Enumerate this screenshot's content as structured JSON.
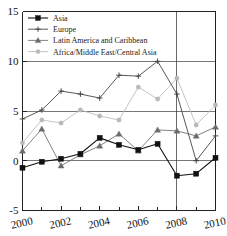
{
  "chart_data": {
    "type": "line",
    "title": "",
    "subtitle": "",
    "xlabel": "",
    "ylabel": "",
    "x": [
      2000,
      2001,
      2002,
      2003,
      2004,
      2005,
      2006,
      2007,
      2008,
      2009,
      2010
    ],
    "xlim": [
      2000,
      2010
    ],
    "ylim": [
      -5,
      15
    ],
    "grid": true,
    "legend_position": "top-left",
    "y_ticks": [
      -5,
      0,
      5,
      10,
      15
    ],
    "y_tick_labels": [
      "-5",
      "0",
      "5",
      "10",
      "15"
    ],
    "x_ticks": [
      2000,
      2001,
      2002,
      2003,
      2004,
      2005,
      2006,
      2007,
      2008,
      2009,
      2010
    ],
    "x_tick_labels_major": [
      "2000",
      "2002",
      "2004",
      "2006",
      "2008",
      "2010"
    ],
    "x_major_ticks": [
      2000,
      2002,
      2004,
      2006,
      2008,
      2010
    ],
    "annotations": [
      {
        "type": "vline",
        "x": 2008,
        "label": ""
      }
    ],
    "series": [
      {
        "name": "Asia",
        "marker": "filled-square",
        "color": "#111111",
        "values": [
          -0.7,
          -0.1,
          0.2,
          0.7,
          2.3,
          1.6,
          1.1,
          1.7,
          -1.5,
          -1.3,
          0.3
        ]
      },
      {
        "name": "Europe",
        "marker": "plus",
        "color": "#3a3a3a",
        "values": [
          4.2,
          5.1,
          7.0,
          6.7,
          6.3,
          8.6,
          8.5,
          10.0,
          6.7,
          0.0,
          2.5
        ]
      },
      {
        "name": "Latin America and Caribbean",
        "marker": "triangle",
        "color": "#6b6b6b",
        "values": [
          1.0,
          3.2,
          -0.5,
          0.6,
          1.5,
          2.7,
          1.0,
          3.1,
          3.0,
          2.5,
          3.4
        ]
      },
      {
        "name": "Africa/Middle East/Central Asia",
        "marker": "circle",
        "color": "#b9b9b9",
        "values": [
          1.8,
          4.1,
          3.8,
          5.1,
          4.5,
          4.1,
          7.4,
          6.2,
          8.3,
          3.6,
          5.6
        ]
      }
    ]
  },
  "legend": {
    "entries": [
      {
        "label": "Asia"
      },
      {
        "label": "Europe"
      },
      {
        "label": "Latin America and Caribbean"
      },
      {
        "label": "Africa/Middle East/Central Asia"
      }
    ]
  }
}
